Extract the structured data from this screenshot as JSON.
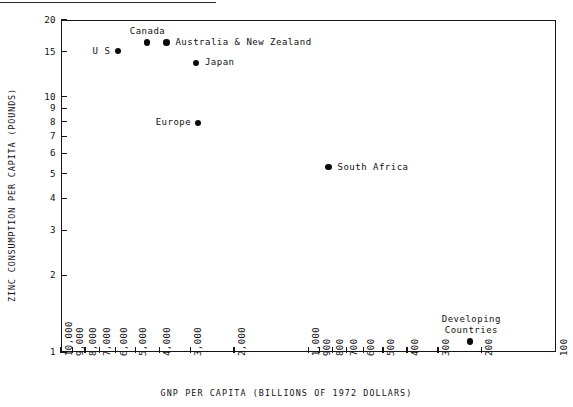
{
  "chart_data": {
    "type": "scatter",
    "title": "",
    "xlabel": "GNP PER CAPITA (BILLIONS OF 1972 DOLLARS)",
    "ylabel": "ZINC CONSUMPTION PER CAPITA (POUNDS)",
    "xscale": "log-reversed",
    "yscale": "log",
    "xlim": [
      10000,
      100
    ],
    "ylim": [
      1,
      20
    ],
    "grid": false,
    "legend": "none",
    "xticks": [
      "10,000",
      "9,000",
      "8,000",
      "7,000",
      "6,000",
      "5,000",
      "4,000",
      "3,000",
      "2,000",
      "1,000",
      "900",
      "800",
      "700",
      "600",
      "500",
      "400",
      "300",
      "200",
      "100"
    ],
    "xtick_values": [
      10000,
      9000,
      8000,
      7000,
      6000,
      5000,
      4000,
      3000,
      2000,
      1000,
      900,
      800,
      700,
      600,
      500,
      400,
      300,
      200,
      100
    ],
    "yticks": [
      "20",
      "15",
      "10",
      "9",
      "8",
      "7",
      "6",
      "5",
      "4",
      "3",
      "2",
      "1"
    ],
    "ytick_values": [
      20,
      15,
      10,
      9,
      8,
      7,
      6,
      5,
      4,
      3,
      2,
      1
    ],
    "points": [
      {
        "label": "U S",
        "x": 5900,
        "y": 15.1,
        "label_pos": "left"
      },
      {
        "label": "Canada",
        "x": 4500,
        "y": 16.3,
        "label_pos": "above"
      },
      {
        "label": "Australia & New Zealand",
        "x": 3750,
        "y": 16.3,
        "label_pos": "right"
      },
      {
        "label": "Japan",
        "x": 2850,
        "y": 13.6,
        "label_pos": "right"
      },
      {
        "label": "Europe",
        "x": 2800,
        "y": 7.9,
        "label_pos": "left"
      },
      {
        "label": "South Africa",
        "x": 830,
        "y": 5.3,
        "label_pos": "right"
      },
      {
        "label": "Developing\nCountries",
        "x": 222,
        "y": 1.1,
        "label_pos": "above"
      }
    ]
  },
  "colors": {
    "marker": "#0b0b0b",
    "axis": "#161616",
    "text": "#111111",
    "background": "#ffffff"
  }
}
